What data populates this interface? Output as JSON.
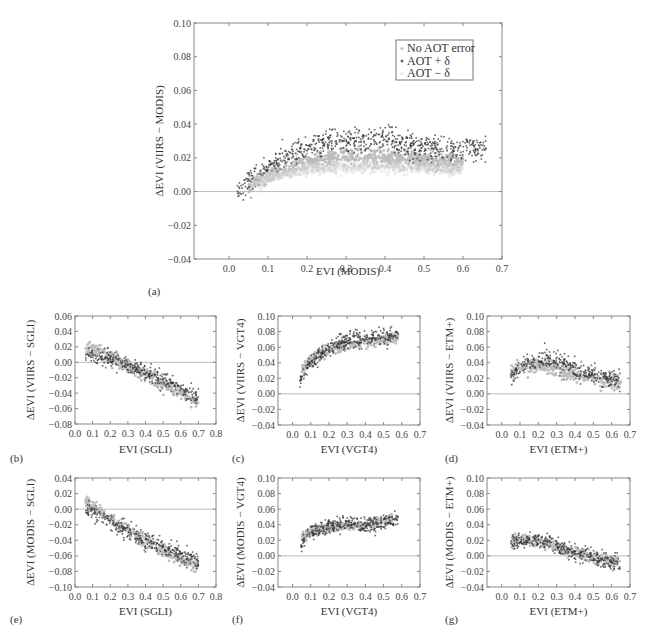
{
  "chart_data": [
    {
      "id": "a",
      "type": "scatter",
      "panel_label": "(a)",
      "xlabel": "EVI (MODIS)",
      "ylabel": "ΔEVI (VIIRS − MODIS)",
      "xlim": [
        -0.09,
        0.7
      ],
      "ylim": [
        -0.04,
        0.1
      ],
      "xticks": [
        0.0,
        0.1,
        0.2,
        0.3,
        0.4,
        0.5,
        0.6,
        0.7
      ],
      "xtick_labels": [
        "0.0",
        "0.1",
        "0.2",
        "0.3",
        "0.4",
        "0.5",
        "0.6",
        "0.7"
      ],
      "yticks": [
        -0.04,
        -0.02,
        0.0,
        0.02,
        0.04,
        0.06,
        0.08,
        0.1
      ],
      "ytick_labels": [
        "−0.04",
        "−0.02",
        "0.00",
        "0.02",
        "0.04",
        "0.06",
        "0.08",
        "0.10"
      ],
      "reference_line_y": 0.0,
      "legend": {
        "position": "top-right",
        "entries": [
          "No AOT error",
          "AOT + δ",
          "AOT − δ"
        ]
      },
      "series": [
        {
          "name": "No AOT error",
          "color": "#bdbdbd",
          "x": [
            0.05,
            0.07,
            0.08,
            0.1,
            0.12,
            0.14,
            0.16,
            0.18,
            0.2,
            0.22,
            0.24,
            0.26,
            0.28,
            0.3,
            0.32,
            0.34,
            0.36,
            0.38,
            0.4,
            0.42,
            0.44,
            0.46,
            0.48,
            0.5,
            0.52,
            0.54,
            0.56,
            0.58,
            0.6
          ],
          "y": [
            0.004,
            0.006,
            0.007,
            0.009,
            0.011,
            0.013,
            0.015,
            0.016,
            0.017,
            0.018,
            0.019,
            0.02,
            0.02,
            0.021,
            0.021,
            0.021,
            0.021,
            0.021,
            0.021,
            0.02,
            0.02,
            0.02,
            0.019,
            0.019,
            0.018,
            0.018,
            0.018,
            0.018,
            0.018
          ],
          "spread": 0.004
        },
        {
          "name": "AOT + δ",
          "color": "#333333",
          "x": [
            0.02,
            0.06,
            0.08,
            0.1,
            0.12,
            0.14,
            0.16,
            0.18,
            0.2,
            0.22,
            0.24,
            0.26,
            0.28,
            0.3,
            0.32,
            0.34,
            0.36,
            0.38,
            0.4,
            0.42,
            0.44,
            0.46,
            0.48,
            0.5,
            0.52,
            0.54,
            0.56,
            0.58,
            0.6,
            0.62,
            0.64,
            0.66
          ],
          "y": [
            0.0,
            0.008,
            0.011,
            0.014,
            0.017,
            0.02,
            0.022,
            0.024,
            0.026,
            0.027,
            0.028,
            0.029,
            0.029,
            0.03,
            0.03,
            0.031,
            0.031,
            0.031,
            0.031,
            0.03,
            0.029,
            0.028,
            0.027,
            0.026,
            0.025,
            0.025,
            0.025,
            0.025,
            0.026,
            0.026,
            0.025,
            0.025
          ],
          "spread": 0.006
        },
        {
          "name": "AOT − δ",
          "color": "#e6e6e6",
          "x": [
            0.06,
            0.1,
            0.15,
            0.2,
            0.25,
            0.3,
            0.35,
            0.4,
            0.45,
            0.5,
            0.55,
            0.6
          ],
          "y": [
            0.005,
            0.008,
            0.011,
            0.013,
            0.014,
            0.015,
            0.015,
            0.015,
            0.014,
            0.014,
            0.013,
            0.013
          ],
          "spread": 0.003
        }
      ]
    },
    {
      "id": "b",
      "type": "scatter",
      "panel_label": "(b)",
      "xlabel": "EVI (SGLI)",
      "ylabel": "ΔEVI (VIIRS − SGLI)",
      "xlim": [
        0.0,
        0.8
      ],
      "ylim": [
        -0.08,
        0.06
      ],
      "xticks": [
        0.0,
        0.1,
        0.2,
        0.3,
        0.4,
        0.5,
        0.6,
        0.7,
        0.8
      ],
      "xtick_labels": [
        "0.0",
        "0.1",
        "0.2",
        "0.3",
        "0.4",
        "0.5",
        "0.6",
        "0.7",
        "0.8"
      ],
      "yticks": [
        -0.08,
        -0.06,
        -0.04,
        -0.02,
        0.0,
        0.02,
        0.04,
        0.06
      ],
      "ytick_labels": [
        "−0.08",
        "−0.06",
        "−0.04",
        "−0.02",
        "0.00",
        "0.02",
        "0.04",
        "0.06"
      ],
      "reference_line_y": 0.0,
      "series": [
        {
          "name": "No AOT error",
          "color": "#bdbdbd",
          "x": [
            0.06,
            0.1,
            0.15,
            0.2,
            0.25,
            0.3,
            0.35,
            0.4,
            0.45,
            0.5,
            0.55,
            0.6,
            0.65,
            0.7
          ],
          "y": [
            0.02,
            0.018,
            0.013,
            0.008,
            0.002,
            -0.004,
            -0.01,
            -0.016,
            -0.022,
            -0.028,
            -0.034,
            -0.04,
            -0.046,
            -0.052
          ],
          "spread": 0.007
        },
        {
          "name": "AOT + δ",
          "color": "#333333",
          "x": [
            0.06,
            0.1,
            0.15,
            0.2,
            0.25,
            0.3,
            0.35,
            0.4,
            0.45,
            0.5,
            0.55,
            0.6,
            0.65,
            0.7
          ],
          "y": [
            0.01,
            0.008,
            0.006,
            0.003,
            0.0,
            -0.004,
            -0.008,
            -0.013,
            -0.018,
            -0.022,
            -0.027,
            -0.033,
            -0.04,
            -0.046
          ],
          "spread": 0.009
        }
      ]
    },
    {
      "id": "c",
      "type": "scatter",
      "panel_label": "(c)",
      "xlabel": "EVI (VGT4)",
      "ylabel": "ΔEVI (VIIRS − VGT4)",
      "xlim": [
        -0.08,
        0.7
      ],
      "ylim": [
        -0.04,
        0.1
      ],
      "xticks": [
        0.0,
        0.1,
        0.2,
        0.3,
        0.4,
        0.5,
        0.6,
        0.7
      ],
      "xtick_labels": [
        "0.0",
        "0.1",
        "0.2",
        "0.3",
        "0.4",
        "0.5",
        "0.6",
        "0.7"
      ],
      "yticks": [
        -0.04,
        -0.02,
        0.0,
        0.02,
        0.04,
        0.06,
        0.08,
        0.1
      ],
      "ytick_labels": [
        "−0.04",
        "−0.02",
        "0.00",
        "0.02",
        "0.04",
        "0.06",
        "0.08",
        "0.10"
      ],
      "reference_line_y": 0.0,
      "series": [
        {
          "name": "No AOT error",
          "color": "#bdbdbd",
          "x": [
            0.05,
            0.08,
            0.1,
            0.15,
            0.2,
            0.25,
            0.3,
            0.35,
            0.4,
            0.45,
            0.5,
            0.55,
            0.58
          ],
          "y": [
            0.03,
            0.038,
            0.044,
            0.052,
            0.057,
            0.06,
            0.062,
            0.064,
            0.066,
            0.068,
            0.07,
            0.072,
            0.073
          ],
          "spread": 0.006
        },
        {
          "name": "AOT + δ",
          "color": "#333333",
          "x": [
            0.04,
            0.06,
            0.1,
            0.15,
            0.2,
            0.25,
            0.3,
            0.35,
            0.4,
            0.45,
            0.5,
            0.55,
            0.58
          ],
          "y": [
            0.015,
            0.025,
            0.04,
            0.05,
            0.058,
            0.064,
            0.068,
            0.07,
            0.072,
            0.073,
            0.074,
            0.075,
            0.076
          ],
          "spread": 0.009
        }
      ]
    },
    {
      "id": "d",
      "type": "scatter",
      "panel_label": "(d)",
      "xlabel": "EVI (ETM+)",
      "ylabel": "ΔEVI (VIIRS − ETM+)",
      "xlim": [
        -0.08,
        0.7
      ],
      "ylim": [
        -0.04,
        0.1
      ],
      "xticks": [
        0.0,
        0.1,
        0.2,
        0.3,
        0.4,
        0.5,
        0.6,
        0.7
      ],
      "xtick_labels": [
        "0.0",
        "0.1",
        "0.2",
        "0.3",
        "0.4",
        "0.5",
        "0.6",
        "0.7"
      ],
      "yticks": [
        -0.04,
        -0.02,
        0.0,
        0.02,
        0.04,
        0.06,
        0.08,
        0.1
      ],
      "ytick_labels": [
        "−0.04",
        "−0.02",
        "0.00",
        "0.02",
        "0.04",
        "0.06",
        "0.08",
        "0.10"
      ],
      "reference_line_y": 0.0,
      "series": [
        {
          "name": "No AOT error",
          "color": "#bdbdbd",
          "x": [
            0.05,
            0.08,
            0.1,
            0.15,
            0.2,
            0.25,
            0.3,
            0.35,
            0.4,
            0.45,
            0.5,
            0.55,
            0.6,
            0.65
          ],
          "y": [
            0.028,
            0.032,
            0.034,
            0.036,
            0.036,
            0.034,
            0.031,
            0.028,
            0.025,
            0.022,
            0.02,
            0.018,
            0.016,
            0.015
          ],
          "spread": 0.008
        },
        {
          "name": "AOT + δ",
          "color": "#333333",
          "x": [
            0.05,
            0.08,
            0.1,
            0.15,
            0.2,
            0.25,
            0.3,
            0.35,
            0.4,
            0.45,
            0.5,
            0.55,
            0.6,
            0.65
          ],
          "y": [
            0.02,
            0.03,
            0.036,
            0.042,
            0.044,
            0.043,
            0.04,
            0.036,
            0.032,
            0.028,
            0.025,
            0.022,
            0.02,
            0.018
          ],
          "spread": 0.011
        }
      ]
    },
    {
      "id": "e",
      "type": "scatter",
      "panel_label": "(e)",
      "xlabel": "EVI (SGLI)",
      "ylabel": "ΔEVI (MODIS − SGLI)",
      "xlim": [
        0.0,
        0.8
      ],
      "ylim": [
        -0.1,
        0.04
      ],
      "xticks": [
        0.0,
        0.1,
        0.2,
        0.3,
        0.4,
        0.5,
        0.6,
        0.7,
        0.8
      ],
      "xtick_labels": [
        "0.0",
        "0.1",
        "0.2",
        "0.3",
        "0.4",
        "0.5",
        "0.6",
        "0.7",
        "0.8"
      ],
      "yticks": [
        -0.1,
        -0.08,
        -0.06,
        -0.04,
        -0.02,
        0.0,
        0.02,
        0.04
      ],
      "ytick_labels": [
        "−0.10",
        "−0.08",
        "−0.06",
        "−0.04",
        "−0.02",
        "0.00",
        "0.02",
        "0.04"
      ],
      "reference_line_y": 0.0,
      "series": [
        {
          "name": "No AOT error",
          "color": "#bdbdbd",
          "x": [
            0.06,
            0.1,
            0.15,
            0.2,
            0.25,
            0.3,
            0.35,
            0.4,
            0.45,
            0.5,
            0.55,
            0.6,
            0.65,
            0.7
          ],
          "y": [
            0.01,
            0.005,
            -0.003,
            -0.012,
            -0.02,
            -0.027,
            -0.034,
            -0.041,
            -0.048,
            -0.054,
            -0.06,
            -0.065,
            -0.07,
            -0.075
          ],
          "spread": 0.006
        },
        {
          "name": "AOT + δ",
          "color": "#333333",
          "x": [
            0.06,
            0.1,
            0.15,
            0.2,
            0.25,
            0.3,
            0.35,
            0.4,
            0.45,
            0.5,
            0.55,
            0.6,
            0.65,
            0.7
          ],
          "y": [
            0.0,
            -0.004,
            -0.01,
            -0.016,
            -0.022,
            -0.028,
            -0.034,
            -0.04,
            -0.045,
            -0.05,
            -0.054,
            -0.058,
            -0.063,
            -0.068
          ],
          "spread": 0.009
        }
      ]
    },
    {
      "id": "f",
      "type": "scatter",
      "panel_label": "(f)",
      "xlabel": "EVI (VGT4)",
      "ylabel": "ΔEVI (MODIS − VGT4)",
      "xlim": [
        -0.08,
        0.7
      ],
      "ylim": [
        -0.04,
        0.1
      ],
      "xticks": [
        0.0,
        0.1,
        0.2,
        0.3,
        0.4,
        0.5,
        0.6,
        0.7
      ],
      "xtick_labels": [
        "0.0",
        "0.1",
        "0.2",
        "0.3",
        "0.4",
        "0.5",
        "0.6",
        "0.7"
      ],
      "yticks": [
        -0.04,
        -0.02,
        0.0,
        0.02,
        0.04,
        0.06,
        0.08,
        0.1
      ],
      "ytick_labels": [
        "−0.04",
        "−0.02",
        "0.00",
        "0.02",
        "0.04",
        "0.06",
        "0.08",
        "0.10"
      ],
      "reference_line_y": 0.0,
      "series": [
        {
          "name": "No AOT error",
          "color": "#bdbdbd",
          "x": [
            0.05,
            0.08,
            0.1,
            0.15,
            0.2,
            0.25,
            0.3,
            0.35,
            0.4,
            0.45,
            0.5,
            0.55
          ],
          "y": [
            0.022,
            0.028,
            0.031,
            0.034,
            0.036,
            0.037,
            0.038,
            0.039,
            0.04,
            0.042,
            0.046,
            0.05
          ],
          "spread": 0.005
        },
        {
          "name": "AOT + δ",
          "color": "#333333",
          "x": [
            0.04,
            0.08,
            0.1,
            0.15,
            0.2,
            0.25,
            0.3,
            0.35,
            0.4,
            0.45,
            0.5,
            0.55,
            0.58
          ],
          "y": [
            0.012,
            0.025,
            0.03,
            0.035,
            0.038,
            0.04,
            0.041,
            0.041,
            0.04,
            0.04,
            0.042,
            0.046,
            0.05
          ],
          "spread": 0.008
        }
      ]
    },
    {
      "id": "g",
      "type": "scatter",
      "panel_label": "(g)",
      "xlabel": "EVI (ETM+)",
      "ylabel": "ΔEVI (MODIS − ETM+)",
      "xlim": [
        -0.08,
        0.7
      ],
      "ylim": [
        -0.04,
        0.1
      ],
      "xticks": [
        0.0,
        0.1,
        0.2,
        0.3,
        0.4,
        0.5,
        0.6,
        0.7
      ],
      "xtick_labels": [
        "0.0",
        "0.1",
        "0.2",
        "0.3",
        "0.4",
        "0.5",
        "0.6",
        "0.7"
      ],
      "yticks": [
        -0.04,
        -0.02,
        0.0,
        0.02,
        0.04,
        0.06,
        0.08,
        0.1
      ],
      "ytick_labels": [
        "−0.04",
        "−0.02",
        "0.00",
        "0.02",
        "0.04",
        "0.06",
        "0.08",
        "0.10"
      ],
      "reference_line_y": 0.0,
      "series": [
        {
          "name": "No AOT error",
          "color": "#bdbdbd",
          "x": [
            0.05,
            0.08,
            0.1,
            0.15,
            0.2,
            0.25,
            0.3,
            0.35,
            0.4,
            0.45,
            0.5,
            0.55,
            0.6,
            0.65
          ],
          "y": [
            0.02,
            0.022,
            0.022,
            0.021,
            0.018,
            0.014,
            0.01,
            0.007,
            0.004,
            0.001,
            -0.002,
            -0.005,
            -0.008,
            -0.011
          ],
          "spread": 0.006
        },
        {
          "name": "AOT + δ",
          "color": "#333333",
          "x": [
            0.05,
            0.08,
            0.1,
            0.15,
            0.2,
            0.25,
            0.3,
            0.35,
            0.4,
            0.45,
            0.5,
            0.55,
            0.6,
            0.65
          ],
          "y": [
            0.012,
            0.018,
            0.02,
            0.022,
            0.02,
            0.017,
            0.013,
            0.009,
            0.005,
            0.002,
            -0.002,
            -0.005,
            -0.008,
            -0.012
          ],
          "spread": 0.009
        }
      ]
    }
  ]
}
